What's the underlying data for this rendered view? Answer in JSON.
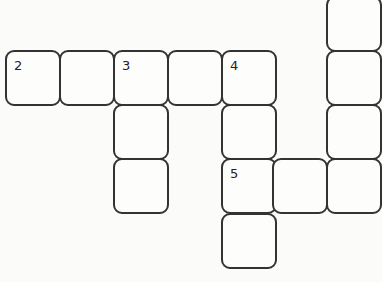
{
  "puzzle": {
    "type": "crossword",
    "cells": [
      {
        "row": 0,
        "col": 6,
        "number": ""
      },
      {
        "row": 1,
        "col": 0,
        "number": "2"
      },
      {
        "row": 1,
        "col": 1,
        "number": ""
      },
      {
        "row": 1,
        "col": 2,
        "number": "3"
      },
      {
        "row": 1,
        "col": 3,
        "number": ""
      },
      {
        "row": 1,
        "col": 4,
        "number": "4"
      },
      {
        "row": 1,
        "col": 6,
        "number": ""
      },
      {
        "row": 2,
        "col": 2,
        "number": ""
      },
      {
        "row": 2,
        "col": 4,
        "number": ""
      },
      {
        "row": 2,
        "col": 6,
        "number": ""
      },
      {
        "row": 3,
        "col": 2,
        "number": ""
      },
      {
        "row": 3,
        "col": 4,
        "number": "5"
      },
      {
        "row": 3,
        "col": 5,
        "number": ""
      },
      {
        "row": 3,
        "col": 6,
        "number": ""
      },
      {
        "row": 4,
        "col": 4,
        "number": ""
      }
    ]
  }
}
